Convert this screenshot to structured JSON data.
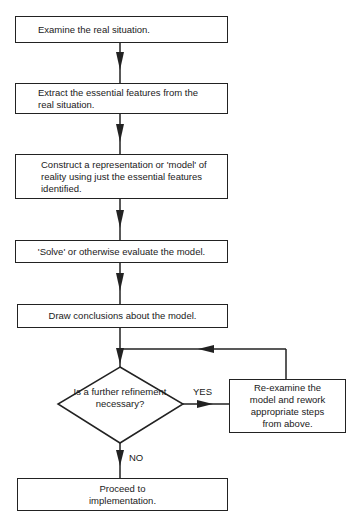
{
  "flowchart": {
    "steps": [
      {
        "id": "examine",
        "text": "Examine the real situation."
      },
      {
        "id": "extract",
        "text": "Extract the essential features from the real situation."
      },
      {
        "id": "construct",
        "text": "Construct a representation or 'model' of reality using just the essential features identified."
      },
      {
        "id": "solve",
        "text": "'Solve' or otherwise evaluate the model."
      },
      {
        "id": "conclude",
        "text": "Draw conclusions about the model."
      }
    ],
    "decision": {
      "text": "Is a further refinement necessary?"
    },
    "yes_branch": {
      "label": "YES",
      "text": "Re-examine the model and rework appropriate steps from above."
    },
    "no_branch": {
      "label": "NO",
      "text": "Proceed to implementation."
    }
  },
  "colors": {
    "line": "#222222",
    "background": "#ffffff"
  }
}
